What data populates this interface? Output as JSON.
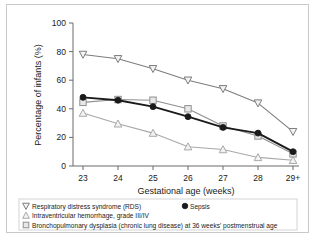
{
  "chart_data": {
    "type": "line",
    "title": "",
    "xlabel": "Gestational age (weeks)",
    "ylabel": "Percentage of infants (%)",
    "categories": [
      "23",
      "24",
      "25",
      "26",
      "27",
      "28",
      "29+"
    ],
    "ylim": [
      0,
      100
    ],
    "yticks": [
      "0",
      "20",
      "40",
      "60",
      "80",
      "100"
    ],
    "grid": false,
    "legend_position": "below-plot",
    "series": [
      {
        "name": "Respiratory distress syndrome (RDS)",
        "marker": "triangle-down",
        "color": "#7d7d7d",
        "values": [
          78,
          75,
          68,
          60,
          54,
          44,
          24
        ]
      },
      {
        "name": "Sepsis",
        "marker": "circle-filled",
        "color": "#1a1a1a",
        "values": [
          48,
          46,
          41.5,
          34.5,
          27,
          23,
          10
        ]
      },
      {
        "name": "Intraventricular hemorrhage, grade III/IV",
        "marker": "triangle-up",
        "color": "#a8a8a8",
        "values": [
          37,
          29.5,
          23,
          13.5,
          11.5,
          6,
          4
        ]
      },
      {
        "name": "Bronchopulmonary dysplasia (chronic lung disease) at 36 weeks' postmenstrual age",
        "marker": "square",
        "color": "#8f8f8f",
        "values": [
          44.5,
          46.5,
          46,
          40,
          28,
          21,
          8.5
        ]
      }
    ]
  },
  "legend": {
    "entries": [
      {
        "label": "Respiratory distress syndrome (RDS)",
        "marker": "triangle-down-icon"
      },
      {
        "label": "Sepsis",
        "marker": "circle-filled-icon"
      },
      {
        "label": "Intraventricular hemorrhage, grade III/IV",
        "marker": "triangle-up-icon"
      },
      {
        "label": "Bronchopulmonary dysplasia (chronic lung disease) at 36 weeks' postmenstrual age",
        "marker": "square-icon"
      }
    ]
  },
  "colors": {
    "rds": "#7d7d7d",
    "sepsis": "#1a1a1a",
    "ivh": "#a8a8a8",
    "bpd": "#8f8f8f",
    "axis": "#6b6b6b",
    "frame": "#c9c9c9"
  }
}
